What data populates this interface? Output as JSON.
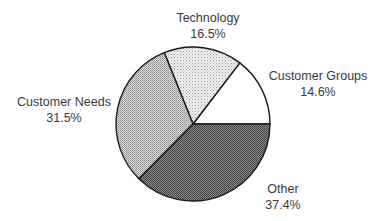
{
  "chart_data": {
    "type": "pie",
    "title": "",
    "start_angle_deg": 0,
    "direction": "counterclockwise",
    "slices": [
      {
        "label": "Customer Groups",
        "value": 14.6,
        "value_label": "14.6%",
        "fill": "white"
      },
      {
        "label": "Technology",
        "value": 16.5,
        "value_label": "16.5%",
        "fill": "light-dots"
      },
      {
        "label": "Customer Needs",
        "value": 31.5,
        "value_label": "31.5%",
        "fill": "medium-dots"
      },
      {
        "label": "Other",
        "value": 37.4,
        "value_label": "37.4%",
        "fill": "dark-dots"
      }
    ],
    "legend": "none",
    "labels_position": "outside"
  },
  "labels": {
    "technology": {
      "name": "Technology",
      "pct": "16.5%"
    },
    "customer_groups": {
      "name": "Customer Groups",
      "pct": "14.6%"
    },
    "customer_needs": {
      "name": "Customer Needs",
      "pct": "31.5%"
    },
    "other": {
      "name": "Other",
      "pct": "37.4%"
    }
  }
}
